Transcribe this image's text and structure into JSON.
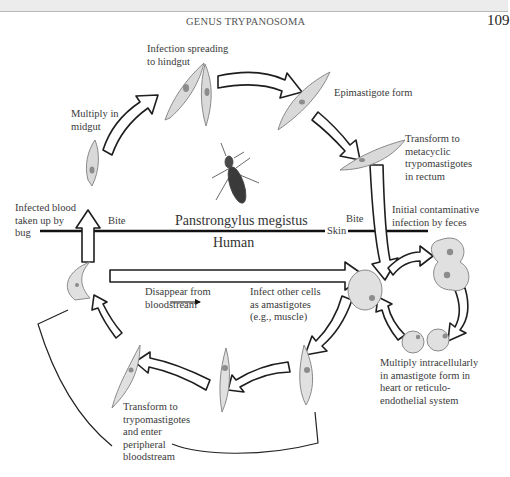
{
  "page": {
    "running_head": "GENUS TRYPANOSOMA",
    "page_number": "109"
  },
  "diagram": {
    "title_vector": "Panstrongylus megistus",
    "host": "Human",
    "boundary": {
      "skin": "Skin",
      "bite_left": "Bite",
      "bite_right": "Bite"
    },
    "bug_cycle_labels": {
      "infected_blood": [
        "Infected blood",
        "taken up by",
        "bug"
      ],
      "multiply_midgut": [
        "Multiply in",
        "midgut"
      ],
      "spreading_hindgut": [
        "Infection spreading",
        "to hindgut"
      ],
      "epimastigote": "Epimastigote form",
      "metacyclic": [
        "Transform to",
        "metacyclic",
        "trypomastigotes",
        "in rectum"
      ]
    },
    "human_cycle_labels": {
      "initial_infection": [
        "Initial contaminative",
        "infection by feces"
      ],
      "disappear": [
        "Disappear from",
        "bloodstream"
      ],
      "infect_other": [
        "Infect other cells",
        "as amastigotes",
        "(e.g., muscle)"
      ],
      "multiply_intracellular": [
        "Multiply intracellularly",
        "in amastigote form in",
        "heart or reticulo-",
        "endothelial system"
      ],
      "transform_trypo": [
        "Transform to",
        "trypomastigotes",
        "and enter",
        "peripheral",
        "bloodstream"
      ]
    },
    "icons": [
      "kissing-bug-icon",
      "epimastigote-icon",
      "trypomastigote-icon",
      "amastigote-cell-icon",
      "cycle-arrow-icon"
    ],
    "colors": {
      "arrow_stroke": "#1e1e1e",
      "arrow_fill": "#ffffff",
      "parasite_fill": "#d9d9d9",
      "parasite_stroke": "#8a8a8a",
      "nucleus": "#8c8c8c",
      "bug_body": "#3a3a3a",
      "boundary_line": "#111111"
    }
  }
}
